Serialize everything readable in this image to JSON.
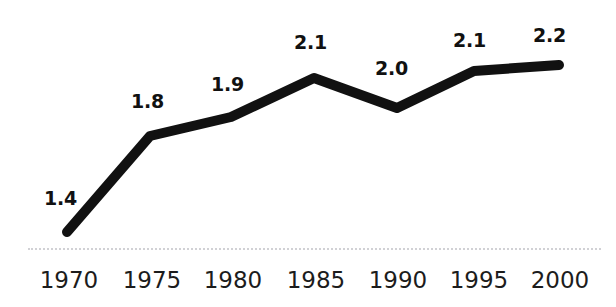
{
  "chart_data": {
    "type": "line",
    "title": "",
    "subtitle": "",
    "xlabel": "",
    "ylabel": "",
    "categories": [
      "1970",
      "1975",
      "1980",
      "1985",
      "1990",
      "1995",
      "2000"
    ],
    "values": [
      1.4,
      1.8,
      1.9,
      2.1,
      2.0,
      2.1,
      2.2
    ],
    "data_labels": [
      "1.4",
      "1.8",
      "1.9",
      "2.1",
      "2.0",
      "2.1",
      "2.2"
    ],
    "series": [
      {
        "name": "",
        "values": [
          1.4,
          1.8,
          1.9,
          2.1,
          2.0,
          2.1,
          2.2
        ]
      }
    ],
    "xlim": [
      "1970",
      "2000"
    ],
    "ylim": [
      1.3,
      2.3
    ],
    "grid": false,
    "legend": false,
    "legend_position": "none",
    "line_color": "#111111",
    "line_width_px": 10,
    "markers": false,
    "axis_line_color": "#c9c9ce",
    "axis_line_style": "dotted",
    "background_color": "#ffffff",
    "label_color": "#111111",
    "tick_label_color": "#1c1c1c"
  },
  "points": [
    {
      "category": "1970",
      "value": "1.4",
      "x": 67,
      "y": 232,
      "label_x": 44,
      "label_y": 189
    },
    {
      "category": "1975",
      "value": "1.8",
      "x": 150,
      "y": 136,
      "label_x": 131,
      "label_y": 92
    },
    {
      "category": "1980",
      "value": "1.9",
      "x": 231,
      "y": 117,
      "label_x": 211,
      "label_y": 75
    },
    {
      "category": "1985",
      "value": "2.1",
      "x": 314,
      "y": 78,
      "label_x": 294,
      "label_y": 33
    },
    {
      "category": "1990",
      "value": "2.0",
      "x": 397,
      "y": 108,
      "label_x": 375,
      "label_y": 59
    },
    {
      "category": "1995",
      "value": "2.1",
      "x": 474,
      "y": 71,
      "label_x": 453,
      "label_y": 31
    },
    {
      "category": "2000",
      "value": "2.2",
      "x": 559,
      "y": 65,
      "label_x": 533,
      "label_y": 26
    }
  ],
  "x_tick_positions": [
    69,
    152,
    233,
    316,
    398,
    479,
    560
  ]
}
